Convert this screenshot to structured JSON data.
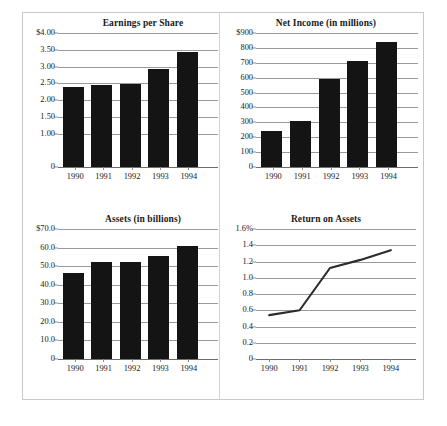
{
  "figure": {
    "background_color": "#ffffff",
    "bar_color": "#141414",
    "grid_color": "#9a9a9a",
    "frame_color": "#c9c9c9",
    "line_color": "#2b2b2b"
  },
  "charts": [
    {
      "id": "earnings-per-share",
      "title": "Earnings per Share",
      "type": "bar",
      "categories": [
        "1990",
        "1991",
        "1992",
        "1993",
        "1994"
      ],
      "values": [
        2.38,
        2.44,
        2.48,
        2.92,
        3.44
      ],
      "ticks": [
        "$4.00",
        "3.50",
        "3.00",
        "2.50",
        "2.00",
        "1.50",
        "1.00",
        "0"
      ],
      "tick_values": [
        4.0,
        3.5,
        3.0,
        2.5,
        2.0,
        1.5,
        1.0,
        0
      ],
      "ylim": [
        0,
        4.0
      ],
      "xlabel": "",
      "ylabel": ""
    },
    {
      "id": "net-income",
      "title": "Net Income (in millions)",
      "type": "bar",
      "categories": [
        "1990",
        "1991",
        "1992",
        "1993",
        "1994"
      ],
      "values": [
        245,
        310,
        590,
        710,
        838
      ],
      "ticks": [
        "$900",
        "800",
        "700",
        "600",
        "500",
        "400",
        "300",
        "200",
        "100",
        "0"
      ],
      "tick_values": [
        900,
        800,
        700,
        600,
        500,
        400,
        300,
        200,
        100,
        0
      ],
      "ylim": [
        0,
        900
      ],
      "xlabel": "",
      "ylabel": ""
    },
    {
      "id": "assets",
      "title": "Assets (in billions)",
      "type": "bar",
      "categories": [
        "1990",
        "1991",
        "1992",
        "1993",
        "1994"
      ],
      "values": [
        46.5,
        52.0,
        52.4,
        55.7,
        61.0
      ],
      "ticks": [
        "$70.0",
        "60.0",
        "50.0",
        "40.0",
        "30.0",
        "20.0",
        "10.0",
        "0"
      ],
      "tick_values": [
        70,
        60,
        50,
        40,
        30,
        20,
        10,
        0
      ],
      "ylim": [
        0,
        70
      ],
      "xlabel": "",
      "ylabel": ""
    },
    {
      "id": "return-on-assets",
      "title": "Return on Assets",
      "type": "line",
      "categories": [
        "1990",
        "1991",
        "1992",
        "1993",
        "1994"
      ],
      "values": [
        0.54,
        0.6,
        1.12,
        1.22,
        1.34
      ],
      "ticks": [
        "1.6%",
        "1.4",
        "1.2",
        "1.0",
        "0.8",
        "0.6",
        "0.4",
        "0.2",
        "0"
      ],
      "tick_values": [
        1.6,
        1.4,
        1.2,
        1.0,
        0.8,
        0.6,
        0.4,
        0.2,
        0
      ],
      "ylim": [
        0,
        1.6
      ],
      "xlabel": "",
      "ylabel": ""
    }
  ],
  "chart_data": [
    {
      "type": "bar",
      "title": "Earnings per Share",
      "categories": [
        "1990",
        "1991",
        "1992",
        "1993",
        "1994"
      ],
      "values": [
        2.38,
        2.44,
        2.48,
        2.92,
        3.44
      ],
      "xlabel": "",
      "ylabel": "",
      "ylim": [
        0,
        4.0
      ],
      "ytick_labels": [
        "$4.00",
        "3.50",
        "3.00",
        "2.50",
        "2.00",
        "1.50",
        "1.00",
        "0"
      ],
      "grid": true,
      "legend": "none"
    },
    {
      "type": "bar",
      "title": "Net Income (in millions)",
      "categories": [
        "1990",
        "1991",
        "1992",
        "1993",
        "1994"
      ],
      "values": [
        245,
        310,
        590,
        710,
        838
      ],
      "xlabel": "",
      "ylabel": "",
      "ylim": [
        0,
        900
      ],
      "ytick_labels": [
        "$900",
        "800",
        "700",
        "600",
        "500",
        "400",
        "300",
        "200",
        "100",
        "0"
      ],
      "grid": true,
      "legend": "none"
    },
    {
      "type": "bar",
      "title": "Assets (in billions)",
      "categories": [
        "1990",
        "1991",
        "1992",
        "1993",
        "1994"
      ],
      "values": [
        46.5,
        52.0,
        52.4,
        55.7,
        61.0
      ],
      "xlabel": "",
      "ylabel": "",
      "ylim": [
        0,
        70
      ],
      "ytick_labels": [
        "$70.0",
        "60.0",
        "50.0",
        "40.0",
        "30.0",
        "20.0",
        "10.0",
        "0"
      ],
      "grid": true,
      "legend": "none"
    },
    {
      "type": "line",
      "title": "Return on Assets",
      "categories": [
        "1990",
        "1991",
        "1992",
        "1993",
        "1994"
      ],
      "values": [
        0.54,
        0.6,
        1.12,
        1.22,
        1.34
      ],
      "xlabel": "",
      "ylabel": "",
      "ylim": [
        0,
        1.6
      ],
      "ytick_labels": [
        "1.6%",
        "1.4",
        "1.2",
        "1.0",
        "0.8",
        "0.6",
        "0.4",
        "0.2",
        "0"
      ],
      "grid": true,
      "legend": "none"
    }
  ]
}
